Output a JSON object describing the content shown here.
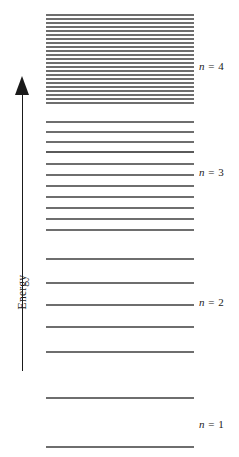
{
  "figure": {
    "type": "energy-level-diagram",
    "background_color": "#ffffff",
    "line_color": "#6e6e6e",
    "axis_color": "#1a1a1a"
  },
  "axis": {
    "label": "Energy",
    "direction": "up",
    "arrow_icon": "up-arrow-icon"
  },
  "levels": [
    {
      "group": "n4",
      "y": 14,
      "thick": false
    },
    {
      "group": "n4",
      "y": 18,
      "thick": false
    },
    {
      "group": "n4",
      "y": 22,
      "thick": false
    },
    {
      "group": "n4",
      "y": 26,
      "thick": false
    },
    {
      "group": "n4",
      "y": 30,
      "thick": false
    },
    {
      "group": "n4",
      "y": 34,
      "thick": false
    },
    {
      "group": "n4",
      "y": 38,
      "thick": false
    },
    {
      "group": "n4",
      "y": 42,
      "thick": false
    },
    {
      "group": "n4",
      "y": 46,
      "thick": false
    },
    {
      "group": "n4",
      "y": 50,
      "thick": false
    },
    {
      "group": "n4",
      "y": 54,
      "thick": false
    },
    {
      "group": "n4",
      "y": 58,
      "thick": false
    },
    {
      "group": "n4",
      "y": 62,
      "thick": false
    },
    {
      "group": "n4",
      "y": 66,
      "thick": false
    },
    {
      "group": "n4",
      "y": 70,
      "thick": false
    },
    {
      "group": "n4",
      "y": 74,
      "thick": false
    },
    {
      "group": "n4",
      "y": 78,
      "thick": false
    },
    {
      "group": "n4",
      "y": 82,
      "thick": false
    },
    {
      "group": "n4",
      "y": 86,
      "thick": false
    },
    {
      "group": "n4",
      "y": 90,
      "thick": false
    },
    {
      "group": "n4",
      "y": 94,
      "thick": false
    },
    {
      "group": "n4",
      "y": 98,
      "thick": false
    },
    {
      "group": "n4",
      "y": 102,
      "thick": false
    },
    {
      "group": "n3",
      "y": 121,
      "thick": false
    },
    {
      "group": "n3",
      "y": 131,
      "thick": false
    },
    {
      "group": "n3",
      "y": 141,
      "thick": false
    },
    {
      "group": "n3",
      "y": 151,
      "thick": true
    },
    {
      "group": "n3",
      "y": 163,
      "thick": false
    },
    {
      "group": "n3",
      "y": 174,
      "thick": false
    },
    {
      "group": "n3",
      "y": 185,
      "thick": false
    },
    {
      "group": "n3",
      "y": 196,
      "thick": false
    },
    {
      "group": "n3",
      "y": 207,
      "thick": false
    },
    {
      "group": "n3",
      "y": 218,
      "thick": false
    },
    {
      "group": "n3",
      "y": 229,
      "thick": false
    },
    {
      "group": "n2",
      "y": 258,
      "thick": false
    },
    {
      "group": "n2",
      "y": 282,
      "thick": false
    },
    {
      "group": "n2",
      "y": 304,
      "thick": false
    },
    {
      "group": "n2",
      "y": 326,
      "thick": false
    },
    {
      "group": "n2",
      "y": 351,
      "thick": false
    },
    {
      "group": "n1",
      "y": 397,
      "thick": false
    },
    {
      "group": "n1",
      "y": 446,
      "thick": false
    }
  ],
  "level_labels": [
    {
      "n_symbol": "n",
      "equals": "=",
      "value": "4",
      "text": "n = 4",
      "y": 61
    },
    {
      "n_symbol": "n",
      "equals": "=",
      "value": "3",
      "text": "n = 3",
      "y": 167
    },
    {
      "n_symbol": "n",
      "equals": "=",
      "value": "2",
      "text": "n = 2",
      "y": 297
    },
    {
      "n_symbol": "n",
      "equals": "=",
      "value": "1",
      "text": "n = 1",
      "y": 419
    }
  ],
  "chart_data": {
    "type": "line",
    "title": "",
    "xlabel": "",
    "ylabel": "Energy",
    "grid": false,
    "legend": "none",
    "series": [
      {
        "name": "n = 4",
        "line_count": 23,
        "y_top": 14,
        "y_bottom": 102,
        "spacing": "dense, ~4 px, near-converged"
      },
      {
        "name": "n = 3",
        "line_count": 11,
        "y_top": 121,
        "y_bottom": 229,
        "spacing": "~10-11 px, widening downward"
      },
      {
        "name": "n = 2",
        "line_count": 5,
        "y_top": 258,
        "y_bottom": 351,
        "spacing": "~23 px"
      },
      {
        "name": "n = 1",
        "line_count": 2,
        "y_top": 397,
        "y_bottom": 446,
        "spacing": "~49 px, widest"
      }
    ],
    "categories": [
      "n = 1",
      "n = 2",
      "n = 3",
      "n = 4"
    ],
    "values": [
      2,
      5,
      11,
      23
    ],
    "axis_note": "Energy increases upward; level spacing decreases with increasing n."
  }
}
